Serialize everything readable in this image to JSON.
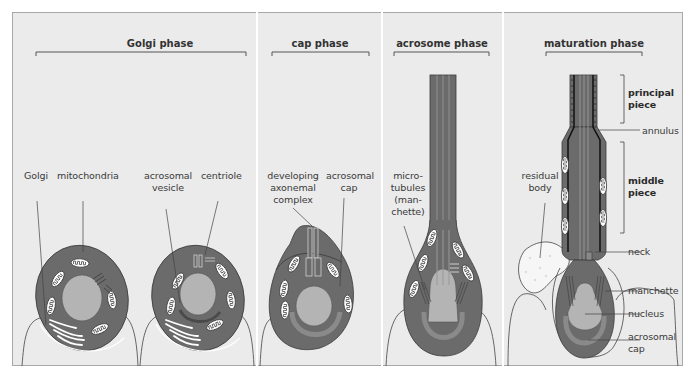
{
  "figure": {
    "colors": {
      "background": "#ebebeb",
      "frame_border": "#a8a8a8",
      "cell_cytoplasm": "#6b6b6b",
      "nucleus": "#b4b4b4",
      "acrosomal_cap": "#8a8a8a",
      "mitochondria_fill": "#ffffff",
      "line": "#3a3a3a",
      "residual_body": "#f4f4f4"
    },
    "panels": [
      {
        "phase": "Golgi phase",
        "labels": [
          "Golgi",
          "mitochondria",
          "acrosomal vesicle",
          "centriole"
        ]
      },
      {
        "phase": "cap phase",
        "labels": [
          "developing axonemal complex",
          "acrosomal cap"
        ]
      },
      {
        "phase": "acrosome phase",
        "labels": [
          "micro-tubules (man-chette)"
        ]
      },
      {
        "phase": "maturation phase",
        "labels": [
          "principal piece",
          "annulus",
          "middle piece",
          "residual body",
          "neck",
          "manchette",
          "nucleus",
          "acrosomal cap"
        ]
      }
    ]
  },
  "labels": {
    "golgi_phase": "Golgi phase",
    "cap_phase": "cap phase",
    "acrosome_phase": "acrosome phase",
    "maturation_phase": "maturation phase",
    "golgi": "Golgi",
    "mitochondria": "mitochondria",
    "acrosomal_vesicle_1": "acrosomal",
    "acrosomal_vesicle_2": "vesicle",
    "centriole": "centriole",
    "developing_1": "developing",
    "developing_2": "axonemal",
    "developing_3": "complex",
    "acrosomal_cap_a1": "acrosomal",
    "acrosomal_cap_a2": "cap",
    "microtubules_1": "micro-",
    "microtubules_2": "tubules",
    "microtubules_3": "(man-",
    "microtubules_4": "chette)",
    "principal_1": "principal",
    "principal_2": "piece",
    "annulus": "annulus",
    "middle_1": "middle",
    "middle_2": "piece",
    "residual_1": "residual",
    "residual_2": "body",
    "neck": "neck",
    "manchette": "manchette",
    "nucleus": "nucleus",
    "acrosomal_cap_b1": "acrosomal",
    "acrosomal_cap_b2": "cap"
  }
}
